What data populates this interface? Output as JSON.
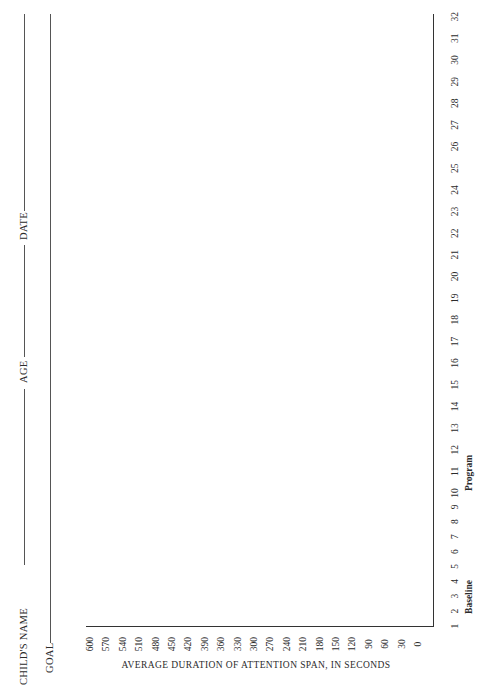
{
  "form": {
    "childs_name_label": "CHILD'S NAME",
    "age_label": "AGE",
    "date_label": "DATE",
    "goal_label": "GOAL"
  },
  "chart_data": {
    "type": "line",
    "title": "",
    "xlabel": "",
    "ylabel": "AVERAGE DURATION OF ATTENTION SPAN, IN SECONDS",
    "x_groups": [
      "Baseline",
      "Program"
    ],
    "x": [
      1,
      2,
      3,
      4,
      5,
      6,
      7,
      8,
      9,
      10,
      11,
      12,
      13,
      14,
      15,
      16,
      17,
      18,
      19,
      20,
      21,
      22,
      23,
      24,
      25,
      26,
      27,
      28,
      29,
      30,
      31,
      32
    ],
    "y_ticks": [
      600,
      570,
      540,
      510,
      480,
      450,
      420,
      390,
      360,
      330,
      300,
      270,
      240,
      210,
      180,
      150,
      120,
      90,
      60,
      30,
      0
    ],
    "ylim": [
      0,
      600
    ],
    "xlim": [
      1,
      32
    ],
    "series": [],
    "grid": false,
    "orientation": "page rotated 90 degrees counter-clockwise"
  }
}
